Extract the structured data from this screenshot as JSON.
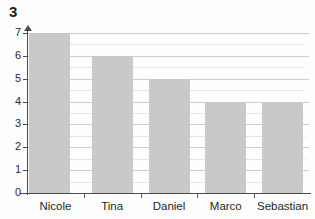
{
  "figure": {
    "number": "3"
  },
  "chart_data": {
    "type": "bar",
    "title": "",
    "subtitle": "",
    "xlabel": "",
    "ylabel": "",
    "categories": [
      "Nicole",
      "Tina",
      "Daniel",
      "Marco",
      "Sebastian"
    ],
    "values": [
      7,
      6,
      5,
      4,
      4
    ],
    "series": [
      {
        "name": "",
        "values": [
          7,
          6,
          5,
          4,
          4
        ]
      }
    ],
    "ylim": [
      0,
      7
    ],
    "xlim": null,
    "ytick_labels": [
      "0",
      "1",
      "2",
      "3",
      "4",
      "5",
      "6",
      "7"
    ],
    "ytick_values": [
      0,
      1,
      2,
      3,
      4,
      5,
      6,
      7
    ],
    "minor_ytick_values": [
      0.5,
      1.5,
      2.5,
      3.5,
      4.5,
      5.5,
      6.5
    ],
    "grid": true,
    "grid_axis": "y",
    "legend": false,
    "legend_position": "none",
    "annotations": [],
    "bar_color": "#c9c9c9",
    "axis_color": "#4a4a4a",
    "gridline_color": "#d6d6d6",
    "text_color": "#1f1f1f"
  }
}
